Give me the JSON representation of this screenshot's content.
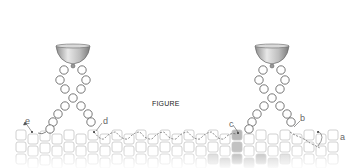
{
  "figure": {
    "caption": "FIGURE",
    "labels": {
      "a": "a",
      "b": "b",
      "c": "c",
      "d": "d",
      "e": "e"
    },
    "holders": [
      {
        "name": "left-holder",
        "cx": 73
      },
      {
        "name": "right-holder",
        "cx": 272
      }
    ],
    "colors": {
      "stroke": "#777777",
      "tile_stroke": "#c8c8c8",
      "tile_shaded": "#b5b5b5",
      "bowl_dark": "#8a8a8a",
      "bowl_light": "#e6e6e6",
      "text": "#222222"
    }
  }
}
